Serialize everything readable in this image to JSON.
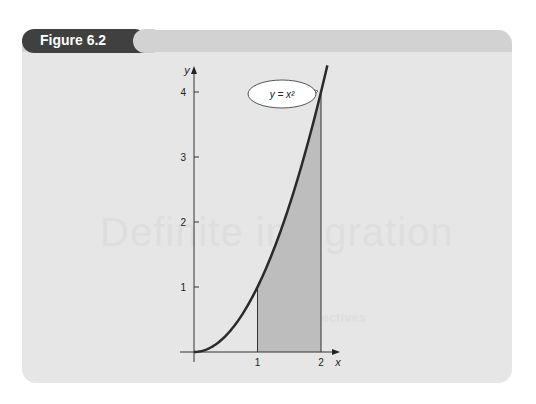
{
  "figure_label": "Figure 6.2",
  "watermark": {
    "title": "Definite integration",
    "subtitle": "Objectives"
  },
  "colors": {
    "curve": "#2a2a2a",
    "shade": "#bdbdbd",
    "tab": "#404040",
    "panel": "#e6e6e6"
  },
  "chart_data": {
    "type": "area",
    "title": "",
    "function": "y = x^2",
    "curve_label": "y = x²",
    "xlabel": "x",
    "ylabel": "y",
    "xlim": [
      0,
      2.3
    ],
    "ylim": [
      0,
      4.4
    ],
    "x_ticks": [
      1,
      2
    ],
    "x_tick_labels": [
      "1",
      "2"
    ],
    "y_ticks": [
      1,
      2,
      3,
      4
    ],
    "y_tick_labels": [
      "1",
      "2",
      "3",
      "4"
    ],
    "shaded_interval": [
      1,
      2
    ],
    "curve_x_range": [
      0,
      2.1
    ],
    "grid": false,
    "legend": "none"
  }
}
